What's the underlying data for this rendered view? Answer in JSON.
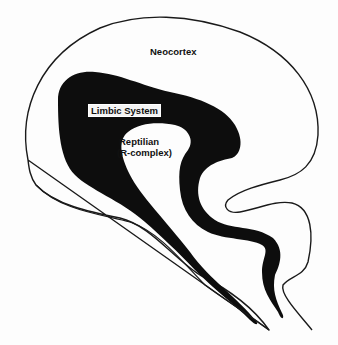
{
  "diagram": {
    "type": "triune-brain-sagittal-section",
    "labels": {
      "neocortex": "Neocortex",
      "limbic": "Limbic System",
      "reptilian_line1": "Reptilian",
      "reptilian_line2": "(R-complex)"
    },
    "colors": {
      "background": "#fdfdfd",
      "outline": "#1a1a1a",
      "limbic_fill": "#0d0d0d",
      "text": "#111111"
    }
  }
}
